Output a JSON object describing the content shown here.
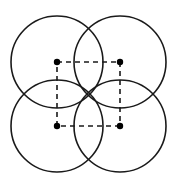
{
  "figure": {
    "canvas": {
      "width": 178,
      "height": 187,
      "background": "#ffffff"
    },
    "style": {
      "circle_stroke_color": "#1a1a1a",
      "circle_stroke_width": 1.6,
      "square_stroke_color": "#1a1a1a",
      "square_stroke_width": 1.6,
      "square_dash_pattern": "5,4",
      "dot_color": "#000000",
      "dot_radius": 3.2
    },
    "geometry": {
      "square_side": 63,
      "circle_radius": 46,
      "square_corners": [
        {
          "name": "top-left",
          "x": 57,
          "y": 62
        },
        {
          "name": "top-right",
          "x": 120,
          "y": 62
        },
        {
          "name": "bottom-right",
          "x": 120,
          "y": 126
        },
        {
          "name": "bottom-left",
          "x": 57,
          "y": 126
        }
      ]
    },
    "circles": [
      {
        "name": "circle-top-left",
        "cx": 57,
        "cy": 62,
        "r": 46
      },
      {
        "name": "circle-top-right",
        "cx": 120,
        "cy": 62,
        "r": 46
      },
      {
        "name": "circle-bottom-left",
        "cx": 57,
        "cy": 126,
        "r": 46
      },
      {
        "name": "circle-bottom-right",
        "cx": 120,
        "cy": 126,
        "r": 46
      }
    ],
    "square_edges": [
      {
        "name": "edge-top",
        "x1": 57,
        "y1": 62,
        "x2": 120,
        "y2": 62
      },
      {
        "name": "edge-right",
        "x1": 120,
        "y1": 62,
        "x2": 120,
        "y2": 126
      },
      {
        "name": "edge-bottom",
        "x1": 120,
        "y1": 126,
        "x2": 57,
        "y2": 126
      },
      {
        "name": "edge-left",
        "x1": 57,
        "y1": 126,
        "x2": 57,
        "y2": 62
      }
    ],
    "vertex_dots": [
      {
        "name": "dot-top-left",
        "cx": 57,
        "cy": 62,
        "r": 3.2
      },
      {
        "name": "dot-top-right",
        "cx": 120,
        "cy": 62,
        "r": 3.2
      },
      {
        "name": "dot-bottom-left",
        "cx": 57,
        "cy": 126,
        "r": 3.2
      },
      {
        "name": "dot-bottom-right",
        "cx": 120,
        "cy": 126,
        "r": 3.2
      }
    ]
  }
}
